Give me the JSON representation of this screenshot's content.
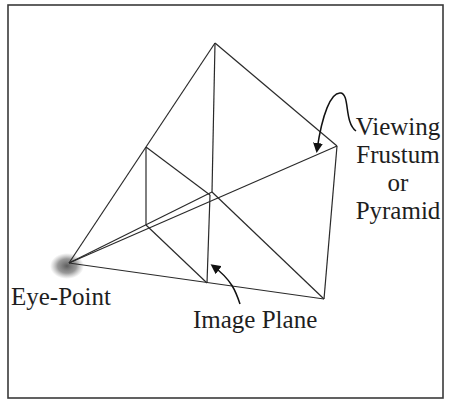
{
  "diagram": {
    "labels": {
      "eye_point": "Eye-Point",
      "image_plane": "Image Plane",
      "frustum_line1": "Viewing",
      "frustum_line2": "Frustum",
      "frustum_line3": "or",
      "frustum_line4": "Pyramid"
    },
    "colors": {
      "line": "#2a2a2a",
      "frame": "#3a3a3a",
      "eye_blur": "#6b6b6b",
      "text": "#1e1e1e"
    }
  }
}
